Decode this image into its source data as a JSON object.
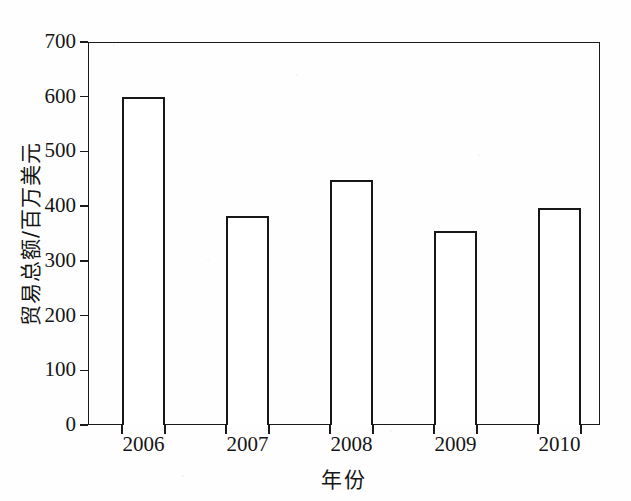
{
  "chart_data": {
    "type": "bar",
    "title": "",
    "categories": [
      "2006",
      "2007",
      "2008",
      "2009",
      "2010"
    ],
    "values": [
      600,
      382,
      448,
      355,
      397
    ],
    "xlabel": "年份",
    "ylabel": "贸易总额/百万美元",
    "ylim": [
      0,
      700
    ],
    "ytick_labels": [
      "0",
      "100",
      "200",
      "300",
      "400",
      "500",
      "600",
      "700"
    ],
    "ytick_values": [
      0,
      100,
      200,
      300,
      400,
      500,
      600,
      700
    ],
    "ytick_step": 100,
    "grid": false,
    "legend": null,
    "legend_position": "none",
    "bar_fill_color": "#ffffff",
    "bar_edge_color": "#171717",
    "axis_color": "#1a1a1a",
    "background_color": "#fefefe",
    "series": [
      {
        "name": "贸易总额",
        "values": [
          600,
          382,
          448,
          355,
          397
        ]
      }
    ],
    "xtick_style": "boundaries"
  }
}
